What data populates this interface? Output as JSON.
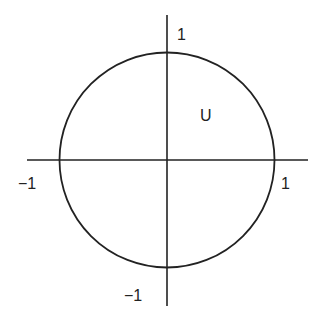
{
  "diagram": {
    "type": "unit-circle",
    "colors": {
      "stroke": "#222222",
      "background": "#ffffff"
    },
    "region_label": "U",
    "labels": {
      "y_top": "1",
      "y_bottom": "−1",
      "x_left": "−1",
      "x_right": "1"
    }
  }
}
